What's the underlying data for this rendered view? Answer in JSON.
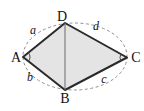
{
  "diagram": {
    "vertex_labels": {
      "top": "D",
      "left": "A",
      "right": "C",
      "bottom": "B"
    },
    "side_labels": {
      "ad": "a",
      "dc": "d",
      "ab": "b",
      "bc": "c"
    },
    "colors": {
      "edge": "#2a2a2a",
      "fill": "#e4e4e4",
      "diagonal": "#6b6b6b",
      "dashed_ellipse": "#909090",
      "angle_arc": "#4a4a4a",
      "text": "#111111",
      "background": "#ffffff"
    }
  }
}
